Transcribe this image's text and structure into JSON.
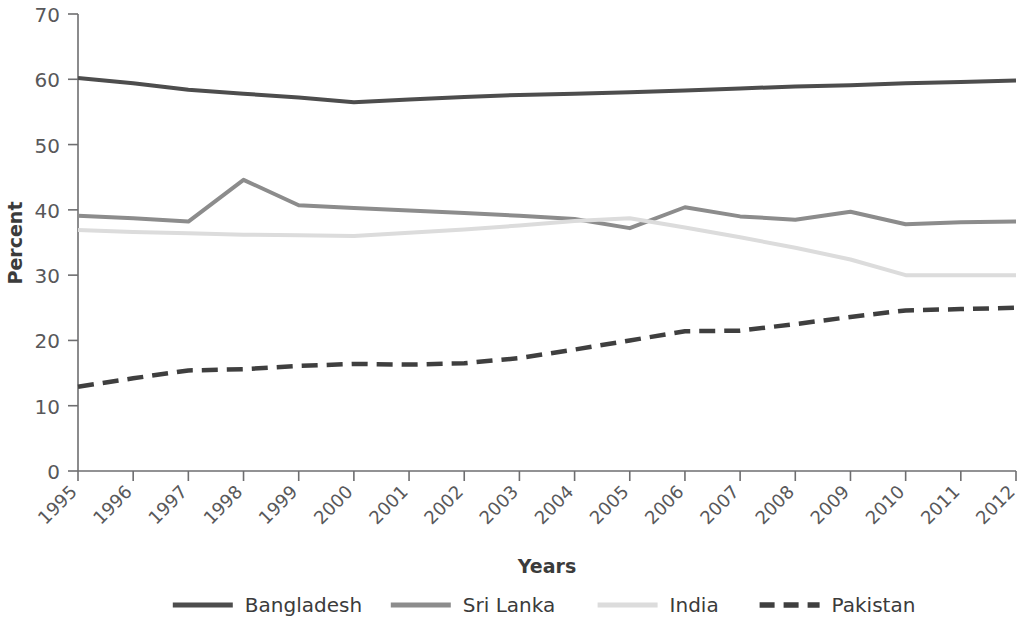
{
  "chart_data": {
    "type": "line",
    "title": "",
    "xlabel": "Years",
    "ylabel": "Percent",
    "x": [
      1995,
      1996,
      1997,
      1998,
      1999,
      2000,
      2001,
      2002,
      2003,
      2004,
      2005,
      2006,
      2007,
      2008,
      2009,
      2010,
      2011,
      2012
    ],
    "categories": [
      "1995",
      "1996",
      "1997",
      "1998",
      "1999",
      "2000",
      "2001",
      "2002",
      "2003",
      "2004",
      "2005",
      "2006",
      "2007",
      "2008",
      "2009",
      "2010",
      "2011",
      "2012"
    ],
    "xlim": [
      1995,
      2012
    ],
    "ylim": [
      0,
      70
    ],
    "yticks": [
      0,
      10,
      20,
      30,
      40,
      50,
      60,
      70
    ],
    "ytick_labels": [
      "0",
      "10",
      "20",
      "30",
      "40",
      "50",
      "60",
      "70"
    ],
    "grid": false,
    "legend_position": "bottom",
    "series": [
      {
        "name": "Bangladesh",
        "color": "#4d4d4d",
        "style": "solid",
        "width": 4,
        "values": [
          60.2,
          59.4,
          58.4,
          57.8,
          57.2,
          56.5,
          56.9,
          57.3,
          57.6,
          57.8,
          58.0,
          58.3,
          58.6,
          58.9,
          59.1,
          59.4,
          59.6,
          59.8
        ]
      },
      {
        "name": "Sri Lanka",
        "color": "#8c8c8c",
        "style": "solid",
        "width": 4,
        "values": [
          39.1,
          38.7,
          38.2,
          44.6,
          40.7,
          40.3,
          39.9,
          39.5,
          39.1,
          38.6,
          37.2,
          40.4,
          39.0,
          38.5,
          39.7,
          37.8,
          38.1,
          38.2
        ]
      },
      {
        "name": "India",
        "color": "#dcdcdc",
        "style": "solid",
        "width": 4,
        "values": [
          36.9,
          36.6,
          36.4,
          36.2,
          36.1,
          36.0,
          36.5,
          37.0,
          37.6,
          38.3,
          38.7,
          37.3,
          35.8,
          34.2,
          32.4,
          30.0,
          30.0,
          30.0
        ]
      },
      {
        "name": "Pakistan",
        "color": "#3f3f3f",
        "style": "dashed",
        "width": 4.5,
        "values": [
          12.9,
          14.2,
          15.4,
          15.6,
          16.1,
          16.4,
          16.3,
          16.5,
          17.3,
          18.6,
          20.0,
          21.4,
          21.5,
          22.5,
          23.6,
          24.6,
          24.8,
          25.0
        ]
      }
    ]
  },
  "legend": {
    "items": [
      {
        "label": "Bangladesh",
        "swatch": "solid-dark"
      },
      {
        "label": "Sri Lanka",
        "swatch": "solid-medium"
      },
      {
        "label": "India",
        "swatch": "solid-light"
      },
      {
        "label": "Pakistan",
        "swatch": "dashed-dark"
      }
    ]
  },
  "colors": {
    "bangladesh": "#4d4d4d",
    "sri_lanka": "#8c8c8c",
    "india": "#dcdcdc",
    "pakistan": "#3f3f3f",
    "axis": "#6e6e70",
    "text": "#58585a",
    "background": "#ffffff"
  }
}
